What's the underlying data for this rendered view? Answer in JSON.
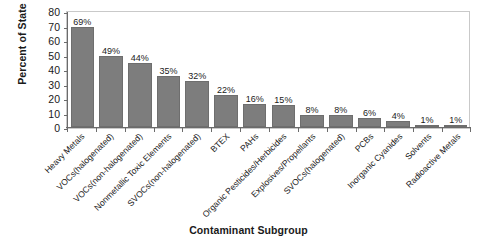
{
  "chart_data": {
    "type": "bar",
    "title": "",
    "xlabel": "Contaminant Subgroup",
    "ylabel": "Percent of State",
    "ylim": [
      0,
      80
    ],
    "yticks": [
      80,
      70,
      60,
      50,
      40,
      30,
      20,
      10,
      0
    ],
    "grid": false,
    "legend": "none",
    "bar_color": "#7d7d7d",
    "categories": [
      "Heavy Metals",
      "VOCs(halogenated)",
      "VOCs(non-halogenated)",
      "Nonmetallic Toxic Elements",
      "SVOCs(non-halogenated)",
      "BTEX",
      "PAHs",
      "Organic Pesticides/Herbicides",
      "Explosives/Propellants",
      "SVOCs(halogenated)",
      "PCBs",
      "Inorganic Cyanides",
      "Solvents",
      "Radioactive Metals"
    ],
    "values": [
      69,
      49,
      44,
      35,
      32,
      22,
      16,
      15,
      8,
      8,
      6,
      4,
      1,
      1
    ],
    "value_labels": [
      "69%",
      "49%",
      "44%",
      "35%",
      "32%",
      "22%",
      "16%",
      "15%",
      "8%",
      "8%",
      "6%",
      "4%",
      "1%",
      "1%"
    ]
  }
}
